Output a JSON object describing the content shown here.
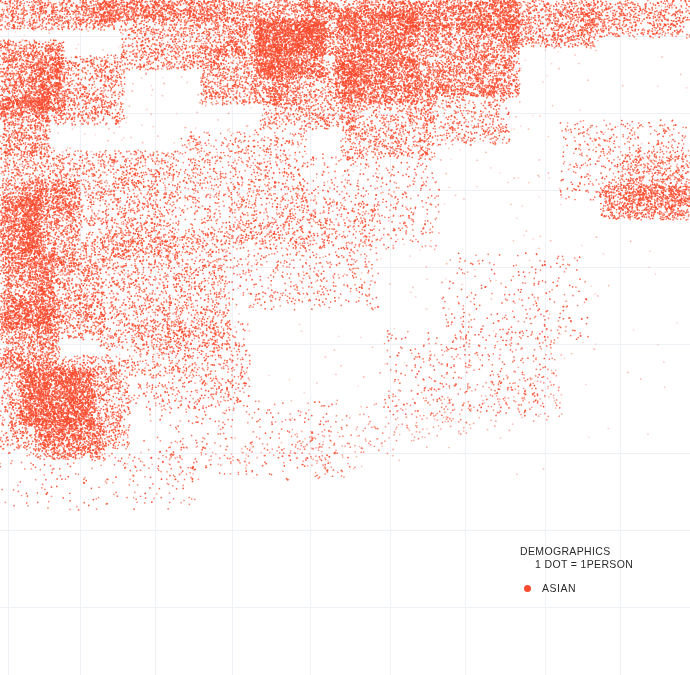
{
  "map": {
    "background_color": "#ffffff",
    "width": 690,
    "height": 675,
    "grid": {
      "visible": true,
      "color": "#eef1f5",
      "vertical_x": [
        8,
        80,
        155,
        232,
        310,
        390,
        465,
        545,
        620
      ],
      "horizontal_y": [
        36,
        113,
        190,
        267,
        344,
        453,
        530,
        607
      ],
      "line_width": 1
    }
  },
  "legend": {
    "title": "DEMOGRAPHICS",
    "subtitle": "1 DOT = 1PERSON",
    "entries": [
      {
        "label": "ASIAN",
        "color": "#fa4b2e",
        "marker": "dot"
      }
    ]
  },
  "chart_data": {
    "type": "scatter",
    "title": "DEMOGRAPHICS",
    "subtitle": "1 DOT = 1PERSON",
    "xlabel": "",
    "ylabel": "",
    "xlim": [
      0,
      690
    ],
    "ylim": [
      0,
      675
    ],
    "grid": true,
    "legend_position": "bottom-right",
    "dot_radius_px": 0.85,
    "series": [
      {
        "name": "ASIAN",
        "color": "#fa4b2e",
        "dot_equals_persons": 1,
        "approx_point_count": 42000,
        "density_regions": [
          {
            "shape": "rect",
            "x": 0,
            "y": 0,
            "w": 120,
            "h": 30,
            "density": 0.45,
            "note": "top-left edge"
          },
          {
            "shape": "rect",
            "x": 95,
            "y": 0,
            "w": 130,
            "h": 22,
            "density": 0.72
          },
          {
            "shape": "rect",
            "x": 215,
            "y": 0,
            "w": 120,
            "h": 55,
            "density": 0.52
          },
          {
            "shape": "rect",
            "x": 255,
            "y": 18,
            "w": 70,
            "h": 60,
            "density": 0.8
          },
          {
            "shape": "rect",
            "x": 300,
            "y": 0,
            "w": 60,
            "h": 40,
            "density": 0.3
          },
          {
            "shape": "rect",
            "x": 335,
            "y": 8,
            "w": 85,
            "h": 95,
            "density": 0.86
          },
          {
            "shape": "rect",
            "x": 355,
            "y": 0,
            "w": 50,
            "h": 20,
            "density": 0.55
          },
          {
            "shape": "rect",
            "x": 400,
            "y": 0,
            "w": 120,
            "h": 30,
            "density": 0.74
          },
          {
            "shape": "rect",
            "x": 415,
            "y": 22,
            "w": 105,
            "h": 75,
            "density": 0.55
          },
          {
            "shape": "rect",
            "x": 500,
            "y": 0,
            "w": 95,
            "h": 48,
            "density": 0.42
          },
          {
            "shape": "rect",
            "x": 580,
            "y": 0,
            "w": 110,
            "h": 38,
            "density": 0.34
          },
          {
            "shape": "rect",
            "x": 120,
            "y": 20,
            "w": 100,
            "h": 50,
            "density": 0.33
          },
          {
            "shape": "rect",
            "x": 200,
            "y": 45,
            "w": 95,
            "h": 60,
            "density": 0.4
          },
          {
            "shape": "rect",
            "x": 260,
            "y": 60,
            "w": 100,
            "h": 70,
            "density": 0.3
          },
          {
            "shape": "rect",
            "x": 340,
            "y": 95,
            "w": 95,
            "h": 65,
            "density": 0.26
          },
          {
            "shape": "rect",
            "x": 420,
            "y": 85,
            "w": 90,
            "h": 60,
            "density": 0.2
          },
          {
            "shape": "rect",
            "x": 0,
            "y": 40,
            "w": 65,
            "h": 75,
            "density": 0.62
          },
          {
            "shape": "rect",
            "x": 0,
            "y": 95,
            "w": 50,
            "h": 60,
            "density": 0.48
          },
          {
            "shape": "rect",
            "x": 30,
            "y": 55,
            "w": 95,
            "h": 70,
            "density": 0.34
          },
          {
            "shape": "rect",
            "x": 0,
            "y": 150,
            "w": 70,
            "h": 60,
            "density": 0.3
          },
          {
            "shape": "rect",
            "x": 0,
            "y": 195,
            "w": 42,
            "h": 60,
            "density": 0.8
          },
          {
            "shape": "rect",
            "x": 20,
            "y": 180,
            "w": 60,
            "h": 90,
            "density": 0.42
          },
          {
            "shape": "rect",
            "x": 0,
            "y": 250,
            "w": 55,
            "h": 80,
            "density": 0.55
          },
          {
            "shape": "rect",
            "x": 35,
            "y": 255,
            "w": 70,
            "h": 85,
            "density": 0.36
          },
          {
            "shape": "rect",
            "x": 0,
            "y": 300,
            "w": 60,
            "h": 70,
            "density": 0.45
          },
          {
            "shape": "rect",
            "x": 20,
            "y": 368,
            "w": 75,
            "h": 58,
            "density": 0.88
          },
          {
            "shape": "rect",
            "x": 0,
            "y": 355,
            "w": 130,
            "h": 95,
            "density": 0.34
          },
          {
            "shape": "rect",
            "x": 35,
            "y": 420,
            "w": 70,
            "h": 40,
            "density": 0.5
          },
          {
            "shape": "rect",
            "x": 60,
            "y": 150,
            "w": 120,
            "h": 110,
            "density": 0.22
          },
          {
            "shape": "rect",
            "x": 100,
            "y": 230,
            "w": 130,
            "h": 120,
            "density": 0.2
          },
          {
            "shape": "rect",
            "x": 130,
            "y": 320,
            "w": 120,
            "h": 90,
            "density": 0.15
          },
          {
            "shape": "rect",
            "x": 180,
            "y": 130,
            "w": 130,
            "h": 120,
            "density": 0.14
          },
          {
            "shape": "rect",
            "x": 230,
            "y": 200,
            "w": 150,
            "h": 110,
            "density": 0.09
          },
          {
            "shape": "rect",
            "x": 300,
            "y": 150,
            "w": 140,
            "h": 100,
            "density": 0.07
          },
          {
            "shape": "rect",
            "x": 600,
            "y": 185,
            "w": 90,
            "h": 35,
            "density": 0.5
          },
          {
            "shape": "rect",
            "x": 620,
            "y": 150,
            "w": 70,
            "h": 60,
            "density": 0.22
          },
          {
            "shape": "rect",
            "x": 560,
            "y": 120,
            "w": 130,
            "h": 80,
            "density": 0.1
          },
          {
            "shape": "band",
            "x1": 300,
            "y1": 455,
            "x2": 560,
            "y2": 385,
            "thickness": 28,
            "density": 0.08,
            "note": "faint diagonal corridor"
          },
          {
            "shape": "band",
            "x1": 120,
            "y1": 470,
            "x2": 330,
            "y2": 440,
            "thickness": 16,
            "density": 0.04
          },
          {
            "shape": "rect",
            "x": 380,
            "y": 330,
            "w": 180,
            "h": 90,
            "density": 0.05
          },
          {
            "shape": "rect",
            "x": 440,
            "y": 250,
            "w": 150,
            "h": 100,
            "density": 0.04
          },
          {
            "shape": "rect",
            "x": 0,
            "y": 440,
            "w": 200,
            "h": 70,
            "density": 0.03
          },
          {
            "shape": "rect",
            "x": 150,
            "y": 400,
            "w": 200,
            "h": 80,
            "density": 0.04
          }
        ]
      }
    ]
  }
}
